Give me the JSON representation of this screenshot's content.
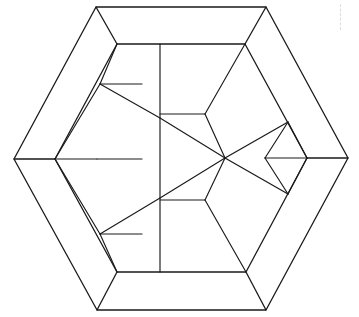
{
  "figure": {
    "canvas": {
      "width": 359,
      "height": 317,
      "background": "#ffffff"
    },
    "stroke_color": "#1a1a1a",
    "fill_color": "#ffffff",
    "stroke_width": 1.15
  },
  "geometry": {
    "outer_hexagon": {
      "name": "outer-hexagon",
      "points": [
        [
          96,
          7
        ],
        [
          266,
          7
        ],
        [
          348,
          158
        ],
        [
          266,
          310
        ],
        [
          97,
          310
        ],
        [
          14,
          159
        ]
      ]
    },
    "inner_hexagon": {
      "name": "inner-hexagon",
      "points": [
        [
          117,
          44
        ],
        [
          245,
          44
        ],
        [
          307,
          158
        ],
        [
          246,
          272
        ],
        [
          117,
          272
        ],
        [
          55,
          159
        ]
      ]
    },
    "border_band_corners": {
      "outer": [
        [
          96,
          7
        ],
        [
          266,
          7
        ],
        [
          348,
          158
        ],
        [
          266,
          310
        ],
        [
          97,
          310
        ],
        [
          14,
          159
        ]
      ],
      "inner": [
        [
          117,
          44
        ],
        [
          245,
          44
        ],
        [
          307,
          158
        ],
        [
          246,
          272
        ],
        [
          117,
          272
        ],
        [
          55,
          159
        ]
      ],
      "spokes": [
        [
          [
            96,
            7
          ],
          [
            117,
            44
          ]
        ],
        [
          [
            266,
            7
          ],
          [
            245,
            44
          ]
        ],
        [
          [
            348,
            158
          ],
          [
            307,
            158
          ]
        ],
        [
          [
            266,
            310
          ],
          [
            246,
            272
          ]
        ],
        [
          [
            97,
            310
          ],
          [
            117,
            272
          ]
        ],
        [
          [
            14,
            159
          ],
          [
            55,
            159
          ]
        ]
      ]
    },
    "inner_pieces": [
      {
        "name": "left-upper-rhombus",
        "points": [
          [
            117,
            44
          ],
          [
            160,
            44
          ],
          [
            142,
            84
          ],
          [
            100,
            84
          ]
        ]
      },
      {
        "name": "left-upper-triangle-outer",
        "points": [
          [
            100,
            84
          ],
          [
            142,
            84
          ],
          [
            160,
            118
          ]
        ]
      },
      {
        "name": "left-mid-upper-rhombus",
        "points": [
          [
            55,
            159
          ],
          [
            100,
            84
          ],
          [
            142,
            84
          ],
          [
            97,
            159
          ]
        ]
      },
      {
        "name": "left-mid-lower-rhombus",
        "points": [
          [
            55,
            159
          ],
          [
            97,
            159
          ],
          [
            142,
            234
          ],
          [
            100,
            234
          ]
        ]
      },
      {
        "name": "left-lower-triangle-outer",
        "points": [
          [
            100,
            234
          ],
          [
            142,
            234
          ],
          [
            160,
            198
          ]
        ]
      },
      {
        "name": "left-lower-rhombus",
        "points": [
          [
            100,
            234
          ],
          [
            142,
            234
          ],
          [
            160,
            272
          ],
          [
            117,
            272
          ]
        ]
      },
      {
        "name": "right-upper-rhombus",
        "points": [
          [
            160,
            44
          ],
          [
            245,
            44
          ],
          [
            205,
            114
          ],
          [
            160,
            114
          ]
        ]
      },
      {
        "name": "right-mid-upper-piece",
        "points": [
          [
            205,
            114
          ],
          [
            245,
            44
          ],
          [
            288,
            122
          ],
          [
            225,
            158
          ]
        ]
      },
      {
        "name": "right-upper-wing-triangle",
        "points": [
          [
            288,
            122
          ],
          [
            265,
            158
          ],
          [
            225,
            158
          ]
        ]
      },
      {
        "name": "right-inner-upper-triangle",
        "points": [
          [
            288,
            122
          ],
          [
            307,
            158
          ],
          [
            265,
            158
          ]
        ]
      },
      {
        "name": "right-inner-lower-triangle",
        "points": [
          [
            288,
            194
          ],
          [
            307,
            158
          ],
          [
            265,
            158
          ]
        ]
      },
      {
        "name": "right-lower-wing-triangle",
        "points": [
          [
            288,
            194
          ],
          [
            265,
            158
          ],
          [
            225,
            158
          ]
        ]
      },
      {
        "name": "right-mid-lower-piece",
        "points": [
          [
            225,
            158
          ],
          [
            288,
            194
          ],
          [
            246,
            272
          ],
          [
            205,
            200
          ]
        ]
      },
      {
        "name": "right-lower-rhombus",
        "points": [
          [
            160,
            272
          ],
          [
            205,
            200
          ],
          [
            246,
            272
          ]
        ]
      },
      {
        "name": "center-triangle",
        "points": [
          [
            160,
            118
          ],
          [
            225,
            158
          ],
          [
            160,
            198
          ]
        ]
      }
    ],
    "internal_edges": [
      {
        "name": "vertical-axis-line",
        "points": [
          [
            160,
            44
          ],
          [
            160,
            272
          ]
        ]
      },
      {
        "name": "left-upper-horizontal",
        "points": [
          [
            100,
            84
          ],
          [
            142,
            84
          ]
        ]
      },
      {
        "name": "left-lower-horizontal",
        "points": [
          [
            100,
            234
          ],
          [
            142,
            234
          ]
        ]
      },
      {
        "name": "left-middle-horizontal",
        "points": [
          [
            55,
            159
          ],
          [
            97,
            159
          ]
        ]
      },
      {
        "name": "right-middle-horizontal",
        "points": [
          [
            265,
            158
          ],
          [
            307,
            158
          ]
        ]
      },
      {
        "name": "left-upper-diagonal-in",
        "points": [
          [
            117,
            44
          ],
          [
            100,
            84
          ]
        ]
      },
      {
        "name": "left-upper-diagonal-out",
        "points": [
          [
            55,
            159
          ],
          [
            100,
            84
          ]
        ]
      },
      {
        "name": "left-lower-diagonal-out",
        "points": [
          [
            55,
            159
          ],
          [
            100,
            234
          ]
        ]
      },
      {
        "name": "left-lower-diagonal-in",
        "points": [
          [
            100,
            234
          ],
          [
            117,
            272
          ]
        ]
      },
      {
        "name": "left-upper-to-center",
        "points": [
          [
            100,
            84
          ],
          [
            160,
            118
          ]
        ]
      },
      {
        "name": "left-lower-to-center",
        "points": [
          [
            100,
            234
          ],
          [
            160,
            198
          ]
        ]
      },
      {
        "name": "left-mid-horizontal-extension",
        "points": [
          [
            97,
            159
          ],
          [
            142,
            159
          ]
        ]
      },
      {
        "name": "center-upper-chord",
        "points": [
          [
            160,
            118
          ],
          [
            225,
            158
          ]
        ]
      },
      {
        "name": "center-lower-chord",
        "points": [
          [
            160,
            198
          ],
          [
            225,
            158
          ]
        ]
      },
      {
        "name": "center-to-upper-right-node",
        "points": [
          [
            225,
            158
          ],
          [
            288,
            122
          ]
        ]
      },
      {
        "name": "center-to-lower-right-node",
        "points": [
          [
            225,
            158
          ],
          [
            288,
            194
          ]
        ]
      },
      {
        "name": "right-upper-fold",
        "points": [
          [
            205,
            114
          ],
          [
            245,
            44
          ]
        ]
      },
      {
        "name": "right-upper-fold-inner",
        "points": [
          [
            160,
            114
          ],
          [
            205,
            114
          ]
        ]
      },
      {
        "name": "right-upper-node-fold",
        "points": [
          [
            205,
            114
          ],
          [
            225,
            158
          ]
        ]
      },
      {
        "name": "right-lower-fold-inner",
        "points": [
          [
            160,
            200
          ],
          [
            205,
            200
          ]
        ]
      },
      {
        "name": "right-lower-fold",
        "points": [
          [
            205,
            200
          ],
          [
            246,
            272
          ]
        ]
      },
      {
        "name": "right-lower-node-fold",
        "points": [
          [
            205,
            200
          ],
          [
            225,
            158
          ]
        ]
      },
      {
        "name": "right-inner-upper-spoke",
        "points": [
          [
            288,
            122
          ],
          [
            307,
            158
          ]
        ]
      },
      {
        "name": "right-inner-lower-spoke",
        "points": [
          [
            288,
            194
          ],
          [
            307,
            158
          ]
        ]
      },
      {
        "name": "right-node-upper-to-inner",
        "points": [
          [
            288,
            122
          ],
          [
            265,
            158
          ]
        ]
      },
      {
        "name": "right-node-lower-to-inner",
        "points": [
          [
            288,
            194
          ],
          [
            265,
            158
          ]
        ]
      }
    ]
  },
  "artifacts": {
    "dashed_mark": {
      "name": "scanner-dashed-artifact",
      "x": 340,
      "y": 4,
      "height": 26,
      "color": "#d8d8d8"
    }
  }
}
